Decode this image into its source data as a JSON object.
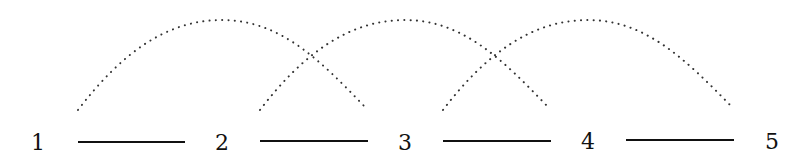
{
  "diagram": {
    "nodes": [
      {
        "label": "1",
        "x": 38
      },
      {
        "label": "2",
        "x": 222
      },
      {
        "label": "3",
        "x": 405
      },
      {
        "label": "4",
        "x": 588
      },
      {
        "label": "5",
        "x": 772
      }
    ],
    "edges": [
      {
        "from": "1",
        "to": "2",
        "x1": 78,
        "x2": 185
      },
      {
        "from": "2",
        "to": "3",
        "x1": 260,
        "x2": 368
      },
      {
        "from": "3",
        "to": "4",
        "x1": 443,
        "x2": 551
      },
      {
        "from": "4",
        "to": "5",
        "x1": 626,
        "x2": 734
      }
    ],
    "arcs": [
      {
        "connects": [
          "1-2",
          "2-3"
        ],
        "style": "dotted"
      },
      {
        "connects": [
          "2-3",
          "3-4"
        ],
        "style": "dotted"
      },
      {
        "connects": [
          "3-4",
          "4-5"
        ],
        "style": "dotted"
      }
    ]
  }
}
